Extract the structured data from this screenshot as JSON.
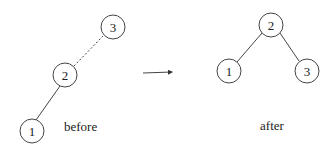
{
  "before": {
    "label": "before",
    "nodes": [
      {
        "id": "1",
        "label": "1"
      },
      {
        "id": "2",
        "label": "2"
      },
      {
        "id": "3",
        "label": "3"
      }
    ],
    "edges": [
      {
        "from": "1",
        "to": "2",
        "style": "solid"
      },
      {
        "from": "2",
        "to": "3",
        "style": "dashed"
      }
    ]
  },
  "after": {
    "label": "after",
    "nodes": [
      {
        "id": "2",
        "label": "2"
      },
      {
        "id": "1",
        "label": "1"
      },
      {
        "id": "3",
        "label": "3"
      }
    ],
    "edges": [
      {
        "from": "2",
        "to": "1",
        "style": "solid"
      },
      {
        "from": "2",
        "to": "3",
        "style": "solid"
      }
    ]
  },
  "arrow": {
    "direction": "right"
  }
}
